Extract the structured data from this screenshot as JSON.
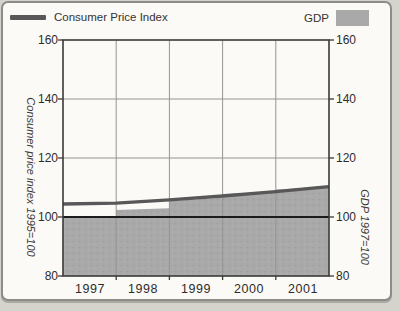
{
  "legend": {
    "cpi": "Consumer Price Index",
    "gdp": "GDP"
  },
  "colors": {
    "page_bg": "#d4d3cc",
    "card_bg": "#fbfaf7",
    "card_border": "#8d8c88",
    "text": "#2e2c2a",
    "cpi_line": "#585858",
    "gdp_fill": "#a9a9a9",
    "gdp_fill_dot": "#9c9c9c",
    "grid": "#969490",
    "frame": "#3a3a38",
    "reference_line": "#1c1c1c"
  },
  "chart_data": {
    "type": "combo",
    "title": "",
    "xlim": [
      1997,
      2002
    ],
    "ylim": [
      80,
      160
    ],
    "yticks": [
      160,
      140,
      120,
      100,
      80
    ],
    "ytick_labels": [
      "160",
      "140",
      "120",
      "100",
      "80"
    ],
    "xtick_labels": [
      "1997",
      "1998",
      "1999",
      "2000",
      "2001"
    ],
    "gridlines_y": [
      140,
      120
    ],
    "gridline_years": [
      1998,
      1999,
      2000,
      2001
    ],
    "reference_line_y": 100,
    "left_axis_label": "Consumer price index 1995=100",
    "right_axis_label": "GDP 1997=100",
    "grid": true,
    "legend_position": "top",
    "series": [
      {
        "name": "Consumer Price Index",
        "type": "line",
        "axis": "left",
        "x": [
          1997,
          1998,
          1999,
          2000,
          2001,
          2002
        ],
        "values": [
          104.4,
          104.7,
          105.8,
          107.1,
          108.6,
          110.3
        ]
      },
      {
        "name": "GDP",
        "type": "step-area",
        "axis": "right",
        "years": [
          1997,
          1998,
          1999,
          2000,
          2001
        ],
        "values_year_start": [
          100,
          102.4,
          105.4,
          107.8,
          109.3
        ],
        "values_year_end": [
          100,
          103.0,
          106.5,
          108.5,
          110.2
        ]
      }
    ]
  }
}
